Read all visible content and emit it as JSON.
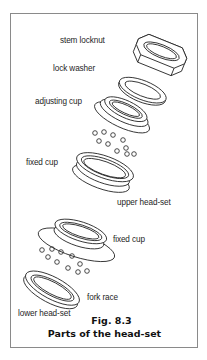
{
  "figure": {
    "number": "Fig. 8.3",
    "title": "Parts of the head-set"
  },
  "labels": {
    "stem_locknut": "stem locknut",
    "lock_washer": "lock washer",
    "adjusting_cup": "adjusting cup",
    "fixed_cup_upper": "fixed cup",
    "upper_head_set": "upper head-set",
    "fixed_cup_lower": "fixed cup",
    "fork_race": "fork race",
    "lower_head_set": "lower head-set"
  },
  "colors": {
    "line": "#1e1e1e",
    "frame": "#8a8a8a",
    "background": "#ffffff"
  }
}
